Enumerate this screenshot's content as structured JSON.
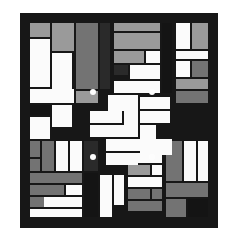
{
  "artwork": {
    "title": "Geometric Quilt Pattern",
    "description": "Abstract rectilinear composition of white, light-gray, mid-gray and black rectangles arranged in nine blocks inside a black border, with a central pinwheel motif and four white dots.",
    "canvas": {
      "width": 236,
      "height": 243,
      "background": "#ffffff"
    },
    "frame": {
      "x": 20,
      "y": 13,
      "width": 198,
      "height": 215,
      "color": "#171717"
    },
    "palette": {
      "background": "#ffffff",
      "frame": "#171717",
      "black": "#141414",
      "dark": "#2a2a2a",
      "mid_gray": "#737373",
      "light_gray": "#9a9a9a",
      "pale_gray": "#b8b8b8",
      "white": "#fbfbfb",
      "dot": "#fdfdfd"
    },
    "counts": {
      "rectangles": 121,
      "dots": 4,
      "blocks": 9
    }
  },
  "chart_data": {
    "type": "table",
    "title": "Geometric Quilt Pattern",
    "xlabel": "x (px, frame-relative)",
    "ylabel": "y (px, frame-relative)",
    "grid": false,
    "legend": [
      "white",
      "pale-gray",
      "light-gray",
      "mid-gray",
      "dark",
      "black"
    ],
    "rectangles": [
      [
        10,
        10,
        20,
        14,
        "light_gray"
      ],
      [
        32,
        10,
        22,
        28,
        "light_gray"
      ],
      [
        10,
        26,
        20,
        48,
        "white"
      ],
      [
        32,
        40,
        20,
        36,
        "white"
      ],
      [
        56,
        10,
        22,
        66,
        "mid_gray"
      ],
      [
        56,
        78,
        22,
        12,
        "light_gray"
      ],
      [
        10,
        76,
        44,
        14,
        "white"
      ],
      [
        10,
        92,
        20,
        10,
        "black"
      ],
      [
        32,
        92,
        20,
        22,
        "white"
      ],
      [
        10,
        104,
        20,
        22,
        "white"
      ],
      [
        80,
        10,
        10,
        66,
        "dark"
      ],
      [
        94,
        10,
        46,
        8,
        "light_gray"
      ],
      [
        94,
        20,
        46,
        16,
        "light_gray"
      ],
      [
        94,
        38,
        30,
        12,
        "light_gray"
      ],
      [
        126,
        38,
        14,
        12,
        "white"
      ],
      [
        94,
        52,
        14,
        10,
        "dark"
      ],
      [
        110,
        52,
        30,
        14,
        "white"
      ],
      [
        94,
        68,
        46,
        12,
        "white"
      ],
      [
        142,
        10,
        10,
        70,
        "black"
      ],
      [
        156,
        10,
        14,
        26,
        "white"
      ],
      [
        172,
        10,
        16,
        26,
        "light_gray"
      ],
      [
        156,
        38,
        32,
        8,
        "white"
      ],
      [
        156,
        48,
        14,
        16,
        "white"
      ],
      [
        172,
        48,
        16,
        16,
        "mid_gray"
      ],
      [
        156,
        66,
        32,
        10,
        "light_gray"
      ],
      [
        156,
        78,
        32,
        12,
        "mid_gray"
      ],
      [
        10,
        128,
        10,
        16,
        "mid_gray"
      ],
      [
        22,
        128,
        12,
        30,
        "mid_gray"
      ],
      [
        36,
        128,
        12,
        30,
        "white"
      ],
      [
        50,
        128,
        12,
        30,
        "white"
      ],
      [
        10,
        146,
        10,
        12,
        "mid_gray"
      ],
      [
        10,
        160,
        52,
        10,
        "mid_gray"
      ],
      [
        10,
        172,
        34,
        10,
        "mid_gray"
      ],
      [
        10,
        184,
        34,
        10,
        "mid_gray"
      ],
      [
        10,
        196,
        52,
        8,
        "white"
      ],
      [
        24,
        184,
        38,
        10,
        "white"
      ],
      [
        46,
        172,
        16,
        10,
        "white"
      ],
      [
        64,
        128,
        14,
        30,
        "dark"
      ],
      [
        64,
        160,
        14,
        44,
        "black"
      ],
      [
        80,
        162,
        12,
        42,
        "white"
      ],
      [
        94,
        162,
        10,
        30,
        "white"
      ],
      [
        108,
        128,
        34,
        10,
        "white"
      ],
      [
        108,
        140,
        34,
        10,
        "white"
      ],
      [
        108,
        152,
        22,
        10,
        "light_gray"
      ],
      [
        132,
        152,
        10,
        10,
        "white"
      ],
      [
        108,
        164,
        34,
        10,
        "white"
      ],
      [
        108,
        176,
        22,
        10,
        "mid_gray"
      ],
      [
        108,
        188,
        34,
        10,
        "mid_gray"
      ],
      [
        132,
        176,
        10,
        10,
        "mid_gray"
      ],
      [
        146,
        128,
        16,
        40,
        "mid_gray"
      ],
      [
        164,
        128,
        12,
        40,
        "white"
      ],
      [
        178,
        128,
        10,
        40,
        "white"
      ],
      [
        146,
        170,
        42,
        14,
        "mid_gray"
      ],
      [
        146,
        186,
        20,
        18,
        "mid_gray"
      ],
      [
        168,
        186,
        20,
        18,
        "black"
      ],
      [
        88,
        82,
        16,
        16,
        "white"
      ],
      [
        104,
        82,
        14,
        30,
        "white"
      ],
      [
        70,
        98,
        32,
        12,
        "white"
      ],
      [
        70,
        112,
        48,
        12,
        "white"
      ],
      [
        120,
        84,
        30,
        12,
        "white"
      ],
      [
        120,
        98,
        30,
        12,
        "white"
      ],
      [
        86,
        126,
        48,
        12,
        "white"
      ],
      [
        86,
        140,
        32,
        12,
        "white"
      ],
      [
        120,
        112,
        16,
        30,
        "white"
      ],
      [
        136,
        126,
        16,
        16,
        "white"
      ]
    ],
    "dots": [
      [
        73,
        79,
        6
      ],
      [
        132,
        79,
        6
      ],
      [
        73,
        144,
        6
      ],
      [
        132,
        144,
        6
      ]
    ]
  }
}
